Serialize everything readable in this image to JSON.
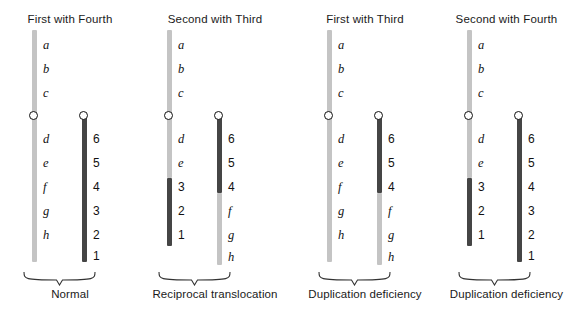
{
  "figure": {
    "background_color": "#ffffff",
    "light_chromatid_color": "#c4c4c4",
    "dark_chromatid_color": "#454545",
    "centromere_color": "#111111"
  },
  "panels": [
    {
      "title": "First with Fourth",
      "caption": "Normal",
      "chromosomes": [
        {
          "name": "chromosome-left",
          "segments": [
            {
              "shade": "light",
              "top": 30,
              "height": 232
            }
          ],
          "centromere_y": 115,
          "labels": [
            {
              "text": "a",
              "y": 45,
              "kind": "letter"
            },
            {
              "text": "b",
              "y": 69,
              "kind": "letter"
            },
            {
              "text": "c",
              "y": 93,
              "kind": "letter"
            },
            {
              "text": "d",
              "y": 139,
              "kind": "letter"
            },
            {
              "text": "e",
              "y": 163,
              "kind": "letter"
            },
            {
              "text": "f",
              "y": 187,
              "kind": "letter"
            },
            {
              "text": "g",
              "y": 211,
              "kind": "letter"
            },
            {
              "text": "h",
              "y": 235,
              "kind": "letter"
            }
          ]
        },
        {
          "name": "chromosome-right",
          "segments": [
            {
              "shade": "dark",
              "top": 115,
              "height": 147
            }
          ],
          "centromere_y": 115,
          "labels": [
            {
              "text": "6",
              "y": 139,
              "kind": "number"
            },
            {
              "text": "5",
              "y": 163,
              "kind": "number"
            },
            {
              "text": "4",
              "y": 187,
              "kind": "number"
            },
            {
              "text": "3",
              "y": 211,
              "kind": "number"
            },
            {
              "text": "2",
              "y": 235,
              "kind": "number"
            },
            {
              "text": "1",
              "y": 256,
              "kind": "number"
            }
          ]
        }
      ]
    },
    {
      "title": "Second with Third",
      "caption": "Reciprocal translocation",
      "chromosomes": [
        {
          "name": "chromosome-left",
          "segments": [
            {
              "shade": "light",
              "top": 30,
              "height": 148
            },
            {
              "shade": "dark",
              "top": 178,
              "height": 68
            }
          ],
          "centromere_y": 115,
          "labels": [
            {
              "text": "a",
              "y": 45,
              "kind": "letter"
            },
            {
              "text": "b",
              "y": 69,
              "kind": "letter"
            },
            {
              "text": "c",
              "y": 93,
              "kind": "letter"
            },
            {
              "text": "d",
              "y": 139,
              "kind": "letter"
            },
            {
              "text": "e",
              "y": 163,
              "kind": "letter"
            },
            {
              "text": "3",
              "y": 187,
              "kind": "number"
            },
            {
              "text": "2",
              "y": 211,
              "kind": "number"
            },
            {
              "text": "1",
              "y": 235,
              "kind": "number"
            }
          ]
        },
        {
          "name": "chromosome-right",
          "segments": [
            {
              "shade": "dark",
              "top": 115,
              "height": 78
            },
            {
              "shade": "light",
              "top": 193,
              "height": 72
            }
          ],
          "centromere_y": 115,
          "labels": [
            {
              "text": "6",
              "y": 139,
              "kind": "number"
            },
            {
              "text": "5",
              "y": 163,
              "kind": "number"
            },
            {
              "text": "4",
              "y": 187,
              "kind": "number"
            },
            {
              "text": "f",
              "y": 211,
              "kind": "letter"
            },
            {
              "text": "g",
              "y": 235,
              "kind": "letter"
            },
            {
              "text": "h",
              "y": 257,
              "kind": "letter"
            }
          ]
        }
      ]
    },
    {
      "title": "First with Third",
      "caption": "Duplication deficiency",
      "chromosomes": [
        {
          "name": "chromosome-left",
          "segments": [
            {
              "shade": "light",
              "top": 30,
              "height": 232
            }
          ],
          "centromere_y": 115,
          "labels": [
            {
              "text": "a",
              "y": 45,
              "kind": "letter"
            },
            {
              "text": "b",
              "y": 69,
              "kind": "letter"
            },
            {
              "text": "c",
              "y": 93,
              "kind": "letter"
            },
            {
              "text": "d",
              "y": 139,
              "kind": "letter"
            },
            {
              "text": "e",
              "y": 163,
              "kind": "letter"
            },
            {
              "text": "f",
              "y": 187,
              "kind": "letter"
            },
            {
              "text": "g",
              "y": 211,
              "kind": "letter"
            },
            {
              "text": "h",
              "y": 235,
              "kind": "letter"
            }
          ]
        },
        {
          "name": "chromosome-right",
          "segments": [
            {
              "shade": "dark",
              "top": 115,
              "height": 78
            },
            {
              "shade": "light",
              "top": 193,
              "height": 72
            }
          ],
          "centromere_y": 115,
          "labels": [
            {
              "text": "6",
              "y": 139,
              "kind": "number"
            },
            {
              "text": "5",
              "y": 163,
              "kind": "number"
            },
            {
              "text": "4",
              "y": 187,
              "kind": "number"
            },
            {
              "text": "f",
              "y": 211,
              "kind": "letter"
            },
            {
              "text": "g",
              "y": 235,
              "kind": "letter"
            },
            {
              "text": "h",
              "y": 257,
              "kind": "letter"
            }
          ]
        }
      ]
    },
    {
      "title": "Second with Fourth",
      "caption": "Duplication deficiency",
      "chromosomes": [
        {
          "name": "chromosome-left",
          "segments": [
            {
              "shade": "light",
              "top": 30,
              "height": 148
            },
            {
              "shade": "dark",
              "top": 178,
              "height": 68
            }
          ],
          "centromere_y": 115,
          "labels": [
            {
              "text": "a",
              "y": 45,
              "kind": "letter"
            },
            {
              "text": "b",
              "y": 69,
              "kind": "letter"
            },
            {
              "text": "c",
              "y": 93,
              "kind": "letter"
            },
            {
              "text": "d",
              "y": 139,
              "kind": "letter"
            },
            {
              "text": "e",
              "y": 163,
              "kind": "letter"
            },
            {
              "text": "3",
              "y": 187,
              "kind": "number"
            },
            {
              "text": "2",
              "y": 211,
              "kind": "number"
            },
            {
              "text": "1",
              "y": 235,
              "kind": "number"
            }
          ]
        },
        {
          "name": "chromosome-right",
          "segments": [
            {
              "shade": "dark",
              "top": 115,
              "height": 147
            }
          ],
          "centromere_y": 115,
          "labels": [
            {
              "text": "6",
              "y": 139,
              "kind": "number"
            },
            {
              "text": "5",
              "y": 163,
              "kind": "number"
            },
            {
              "text": "4",
              "y": 187,
              "kind": "number"
            },
            {
              "text": "3",
              "y": 211,
              "kind": "number"
            },
            {
              "text": "2",
              "y": 235,
              "kind": "number"
            },
            {
              "text": "1",
              "y": 256,
              "kind": "number"
            }
          ]
        }
      ]
    }
  ]
}
